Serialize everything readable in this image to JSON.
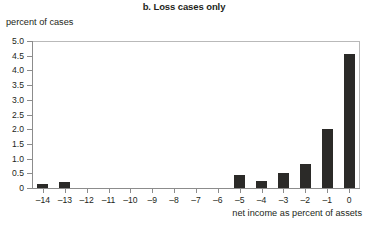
{
  "chart_data": {
    "type": "bar",
    "title": "b. Loss cases only",
    "xlabel": "net income as percent of assets",
    "ylabel": "percent of cases",
    "categories": [
      "–14",
      "–13",
      "–12",
      "–11",
      "–10",
      "–9",
      "–8",
      "–7",
      "–6",
      "–5",
      "–4",
      "–3",
      "–2",
      "–1",
      "0"
    ],
    "values": [
      0.15,
      0.2,
      0,
      0,
      0,
      0,
      0,
      0,
      0,
      0.45,
      0.25,
      0.5,
      0.8,
      2.0,
      4.55
    ],
    "ylim": [
      0,
      5.0
    ],
    "ytick_labels": [
      "5.0",
      "4.5",
      "4.0",
      "3.5",
      "3.0",
      "2.5",
      "2.0",
      "1.5",
      "1.0",
      "0.5",
      "0"
    ],
    "ytick_values": [
      5.0,
      4.5,
      4.0,
      3.5,
      3.0,
      2.5,
      2.0,
      1.5,
      1.0,
      0.5,
      0
    ],
    "grid": false,
    "legend": null,
    "bar_color": "#2b2a28",
    "axis_color": "#8c8c8c"
  }
}
